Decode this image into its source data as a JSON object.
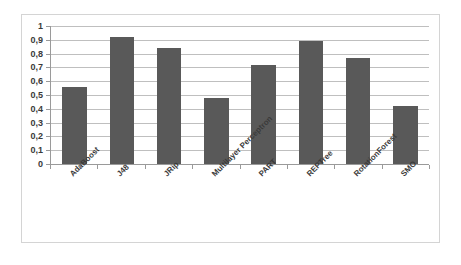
{
  "chart_data": {
    "type": "bar",
    "title": "",
    "xlabel": "",
    "ylabel": "",
    "categories": [
      "AdaBoost",
      "J48",
      "JRip",
      "Multilayer Perceptron",
      "PART",
      "REPTree",
      "RotationForest",
      "SMO"
    ],
    "values": [
      0.56,
      0.92,
      0.84,
      0.48,
      0.72,
      0.89,
      0.77,
      0.42
    ],
    "ylim": [
      0,
      1
    ],
    "ytick_labels": [
      "0",
      "0,1",
      "0,2",
      "0,3",
      "0,4",
      "0,5",
      "0,6",
      "0,7",
      "0,8",
      "0,9",
      "1"
    ],
    "ytick_values": [
      0,
      0.1,
      0.2,
      0.3,
      0.4,
      0.5,
      0.6,
      0.7,
      0.8,
      0.9,
      1
    ],
    "grid": true,
    "legend": "none",
    "bar_color": "#595959",
    "gridline_color": "#bfbfbf",
    "axis_color": "#9a9a9a",
    "frame_color": "#d4d4d4",
    "background_color": "#ffffff"
  }
}
